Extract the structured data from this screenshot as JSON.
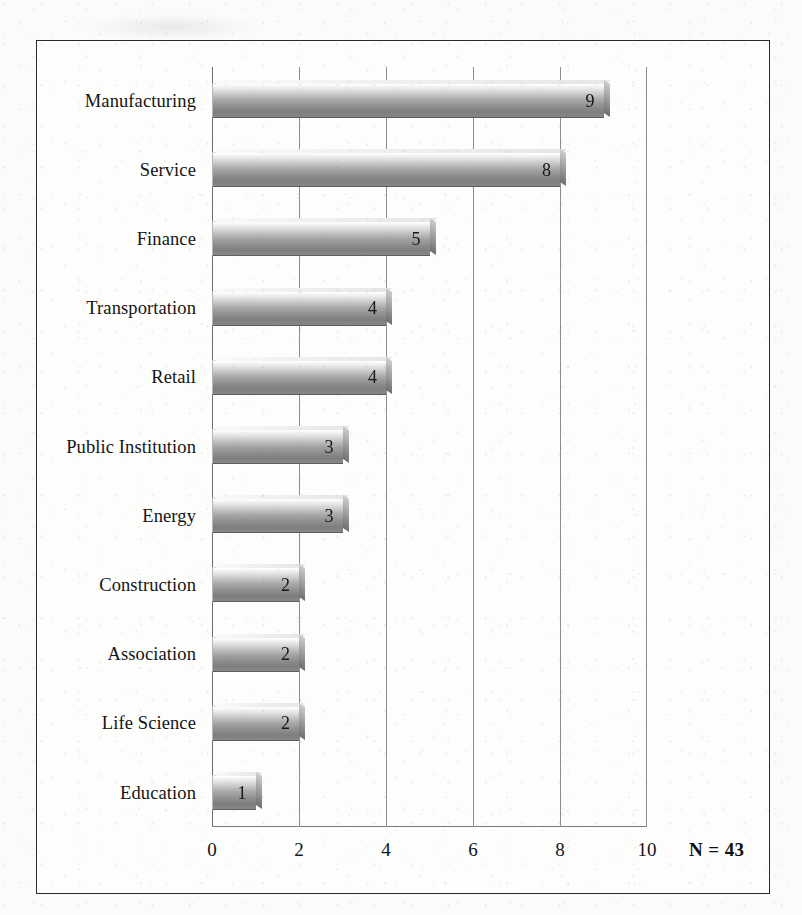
{
  "chart_data": {
    "type": "bar",
    "orientation": "horizontal",
    "title": "",
    "subtitle": "",
    "xlabel": "",
    "ylabel": "",
    "categories": [
      "Manufacturing",
      "Service",
      "Finance",
      "Transportation",
      "Retail",
      "Public Institution",
      "Energy",
      "Construction",
      "Association",
      "Life Science",
      "Education"
    ],
    "values": [
      9,
      8,
      5,
      4,
      4,
      3,
      3,
      2,
      2,
      2,
      1
    ],
    "data_labels": [
      "9",
      "8",
      "5",
      "4",
      "4",
      "3",
      "3",
      "2",
      "2",
      "2",
      "1"
    ],
    "xlim": [
      0,
      10
    ],
    "xticks": [
      0,
      2,
      4,
      6,
      8,
      10
    ],
    "xtick_labels": [
      "0",
      "2",
      "4",
      "6",
      "8",
      "10"
    ],
    "grid": "vertical",
    "legend": "none",
    "annotations": [
      {
        "name": "sample-size",
        "text": "N = 43",
        "position": "bottom-right"
      }
    ],
    "bar_style": {
      "fill": "#a8a8a8",
      "gradient_top": "#fafafa",
      "gradient_bottom": "#7e7e7e",
      "effect": "3d-bevel"
    },
    "colors": {
      "background": "#fdfdfc",
      "frame_border": "#2a2a2a",
      "gridline": "#8d8d8d",
      "text": "#141414"
    }
  },
  "annotation": {
    "sample_size": "N = 43"
  }
}
